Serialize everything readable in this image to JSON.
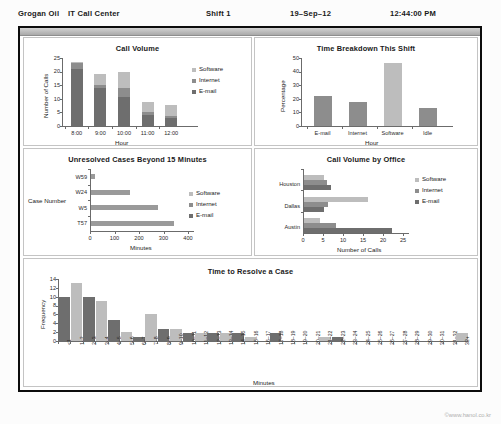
{
  "header": {
    "company": "Grogan Oil",
    "department": "IT Call Center",
    "shift": "Shift 1",
    "date": "19–Sep–12",
    "time": "12:44:00 PM"
  },
  "footer": {
    "copyright": "©www.hanol.co.kr"
  },
  "colors": {
    "software": "#bdbdbd",
    "internet": "#8d8d8d",
    "email": "#6e6e6e",
    "frame": "#0c0c0c",
    "panel_border": "#c4c4c4",
    "axis": "#6b6b6b"
  },
  "legend_labels": {
    "software": "Software",
    "internet": "Internet",
    "email": "E-mail"
  },
  "chart_data": [
    {
      "id": "call_volume",
      "type": "bar",
      "stacked": true,
      "title": "Call Volume",
      "xlabel": "Hour",
      "ylabel": "Number of Calls",
      "categories": [
        "8:00",
        "9:00",
        "10:00",
        "11:00",
        "12:00"
      ],
      "ylim": [
        0,
        25
      ],
      "yticks": [
        0,
        5,
        10,
        15,
        20,
        25
      ],
      "grid": false,
      "legend": [
        "Software",
        "Internet",
        "E-mail"
      ],
      "legend_position": "right",
      "series": [
        {
          "name": "E-mail",
          "values": [
            21.0,
            14.0,
            10.8,
            4.2,
            2.8
          ]
        },
        {
          "name": "Internet",
          "values": [
            2.0,
            1.2,
            3.0,
            0.8,
            0.9
          ]
        },
        {
          "name": "Software",
          "values": [
            0.5,
            3.8,
            6.2,
            3.9,
            3.9
          ]
        }
      ],
      "totals": [
        23.5,
        19.0,
        20.0,
        8.9,
        7.6
      ]
    },
    {
      "id": "time_breakdown",
      "type": "bar",
      "stacked": false,
      "title": "Time Breakdown This Shift",
      "xlabel": "Hour",
      "ylabel": "Percentage",
      "categories": [
        "E-mail",
        "Internet",
        "Software",
        "Idle"
      ],
      "values": [
        22,
        17.5,
        46,
        13.5
      ],
      "bar_colors": [
        "#8d8d8d",
        "#8d8d8d",
        "#bdbdbd",
        "#8d8d8d"
      ],
      "ylim": [
        0,
        50
      ],
      "yticks": [
        0,
        10,
        20,
        30,
        40,
        50
      ],
      "grid": false
    },
    {
      "id": "unresolved_cases",
      "type": "bar",
      "orientation": "horizontal",
      "title": "Unresolved Cases Beyond 15 Minutes",
      "xlabel": "Minutes",
      "ylabel": "Case Number",
      "categories": [
        "T57",
        "W5",
        "W24",
        "W59"
      ],
      "values": [
        340,
        272,
        160,
        15
      ],
      "bar_color": "#9a9a9a",
      "xlim": [
        0,
        400
      ],
      "xticks": [
        0,
        100,
        200,
        300,
        400
      ],
      "grid": false,
      "legend": [
        "Software",
        "Internet",
        "E-mail"
      ],
      "legend_position": "right"
    },
    {
      "id": "call_volume_by_office",
      "type": "bar",
      "orientation": "horizontal",
      "grouped": true,
      "title": "Call Volume by Office",
      "xlabel": "Number of Calls",
      "ylabel": "",
      "categories": [
        "Austin",
        "Dallas",
        "Houston"
      ],
      "xlim": [
        0,
        25
      ],
      "xticks": [
        0,
        5,
        10,
        15,
        20,
        25
      ],
      "grid": false,
      "legend": [
        "Software",
        "Internet",
        "E-mail"
      ],
      "legend_position": "right",
      "series": [
        {
          "name": "E-mail",
          "values": [
            22.0,
            5.0,
            6.8
          ]
        },
        {
          "name": "Internet",
          "values": [
            8.0,
            6.0,
            5.7
          ]
        },
        {
          "name": "Software",
          "values": [
            4.0,
            16.0,
            5.0
          ]
        }
      ]
    },
    {
      "id": "time_to_resolve",
      "type": "bar",
      "title": "Time to Resolve a Case",
      "xlabel": "Minutes",
      "ylabel": "Frequency",
      "ylim": [
        0,
        14
      ],
      "yticks": [
        0,
        2,
        4,
        6,
        8,
        10,
        12,
        14
      ],
      "grid": false,
      "categories": [
        "<1",
        "1–2",
        "2–3",
        "3–4",
        "4–5",
        "5–6",
        "6–7",
        "7–8",
        "8–9",
        "9–10",
        "10–11",
        "11–12",
        "12–13",
        "13–14",
        "14–15",
        "15–16",
        "16–17",
        "17–18",
        "18–19",
        "19–20",
        "20–21",
        "21–22",
        "22–23",
        "23–24",
        "24–25",
        "25–26",
        "26–27",
        "27–28",
        "28–29",
        "29–30",
        "30–31",
        "31–32",
        "32+"
      ],
      "values": [
        10,
        13,
        10,
        9,
        4.7,
        2,
        0.8,
        6,
        2.6,
        2.6,
        1.8,
        1.8,
        1.8,
        1.8,
        1.8,
        0.8,
        0,
        1.8,
        0,
        0,
        0,
        0.9,
        1.0,
        0,
        0,
        0,
        0,
        0,
        0,
        0,
        0,
        0,
        1.8
      ],
      "bar_colors": [
        "#6e6e6e",
        "#bdbdbd",
        "#6e6e6e",
        "#bdbdbd",
        "#6e6e6e",
        "#bdbdbd",
        "#6e6e6e",
        "#bdbdbd",
        "#6e6e6e",
        "#bdbdbd",
        "#6e6e6e",
        "#bdbdbd",
        "#6e6e6e",
        "#bdbdbd",
        "#6e6e6e",
        "#bdbdbd",
        "#6e6e6e",
        "#6e6e6e",
        "#bdbdbd",
        "#6e6e6e",
        "#bdbdbd",
        "#bdbdbd",
        "#6e6e6e",
        "#bdbdbd",
        "#6e6e6e",
        "#bdbdbd",
        "#6e6e6e",
        "#bdbdbd",
        "#6e6e6e",
        "#bdbdbd",
        "#6e6e6e",
        "#bdbdbd",
        "#bdbdbd"
      ]
    }
  ]
}
